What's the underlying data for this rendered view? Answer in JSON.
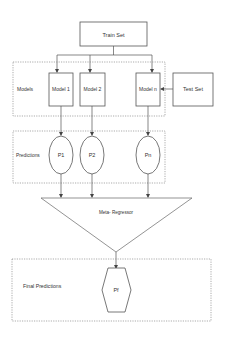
{
  "diagram": {
    "type": "stacking-ensemble-flowchart",
    "colors": {
      "stroke": "#555555",
      "dashed": "#888888",
      "text": "#333333",
      "background": "#ffffff"
    },
    "nodes": {
      "train_set": {
        "label": "Train Set"
      },
      "test_set": {
        "label": "Test Set"
      },
      "models_group": {
        "label": "Models"
      },
      "model_1": {
        "label": "Model 1"
      },
      "model_2": {
        "label": "Model 2"
      },
      "model_n": {
        "label": "Model n"
      },
      "predictions_group": {
        "label": "Predictions"
      },
      "p1": {
        "label": "P1"
      },
      "p2": {
        "label": "P2"
      },
      "pn": {
        "label": "Pn"
      },
      "meta_regressor": {
        "label": "Meta- Regressor"
      },
      "final_group": {
        "label": "Final Predictions"
      },
      "pf": {
        "label": "Pf"
      }
    },
    "edges": [
      {
        "from": "train_set",
        "to": "model_1"
      },
      {
        "from": "train_set",
        "to": "model_2"
      },
      {
        "from": "train_set",
        "to": "model_n"
      },
      {
        "from": "test_set",
        "to": "model_n"
      },
      {
        "from": "model_1",
        "to": "p1"
      },
      {
        "from": "model_2",
        "to": "p2"
      },
      {
        "from": "model_n",
        "to": "pn"
      },
      {
        "from": "p1",
        "to": "meta_regressor"
      },
      {
        "from": "p2",
        "to": "meta_regressor"
      },
      {
        "from": "pn",
        "to": "meta_regressor"
      },
      {
        "from": "meta_regressor",
        "to": "pf"
      }
    ]
  }
}
